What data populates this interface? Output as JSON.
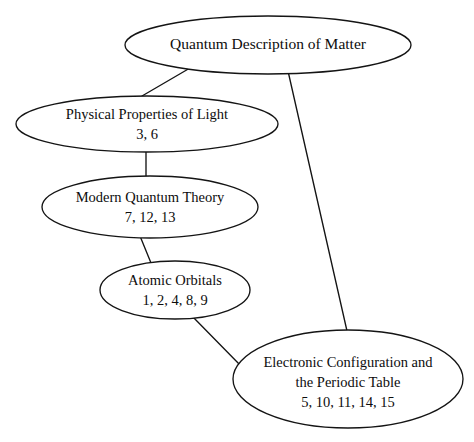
{
  "diagram": {
    "type": "concept-map",
    "background_color": "#ffffff",
    "stroke_color": "#141414",
    "text_color": "#0d0d0d",
    "nodes": [
      {
        "id": "quantum-description-of-matter",
        "label": "Quantum Description of Matter",
        "numbers": "",
        "cx": 268,
        "cy": 45,
        "rx": 143,
        "ry": 29
      },
      {
        "id": "physical-properties-of-light",
        "label": "Physical Properties of Light",
        "numbers": "3, 6",
        "cx": 147,
        "cy": 124,
        "rx": 131,
        "ry": 28
      },
      {
        "id": "modern-quantum-theory",
        "label": "Modern Quantum Theory",
        "numbers": "7, 12, 13",
        "cx": 150,
        "cy": 207,
        "rx": 108,
        "ry": 31
      },
      {
        "id": "atomic-orbitals",
        "label": "Atomic Orbitals",
        "numbers": "1, 2, 4, 8, 9",
        "cx": 175,
        "cy": 290,
        "rx": 75,
        "ry": 29
      },
      {
        "id": "electronic-configuration-and-the-periodic-table",
        "label_line1": "Electronic Configuration and",
        "label_line2": "the Periodic Table",
        "numbers": "5, 10, 11, 14, 15",
        "cx": 348,
        "cy": 379,
        "rx": 115,
        "ry": 49
      }
    ],
    "edges": [
      {
        "id": "edge-matter-to-light",
        "from": "quantum-description-of-matter",
        "to": "physical-properties-of-light",
        "x1": 190,
        "y1": 68,
        "x2": 142,
        "y2": 96
      },
      {
        "id": "edge-matter-to-electronic-configuration",
        "from": "quantum-description-of-matter",
        "to": "electronic-configuration-and-the-periodic-table",
        "x1": 288,
        "y1": 71,
        "x2": 347,
        "y2": 331
      },
      {
        "id": "edge-light-to-modern-quantum-theory",
        "from": "physical-properties-of-light",
        "to": "modern-quantum-theory",
        "x1": 146,
        "y1": 151,
        "x2": 146,
        "y2": 177
      },
      {
        "id": "edge-modern-quantum-theory-to-atomic-orbitals",
        "from": "modern-quantum-theory",
        "to": "atomic-orbitals",
        "x1": 140,
        "y1": 236,
        "x2": 151,
        "y2": 263
      },
      {
        "id": "edge-atomic-orbitals-to-electronic-configuration",
        "from": "atomic-orbitals",
        "to": "electronic-configuration-and-the-periodic-table",
        "x1": 192,
        "y1": 316,
        "x2": 241,
        "y2": 366
      }
    ]
  }
}
